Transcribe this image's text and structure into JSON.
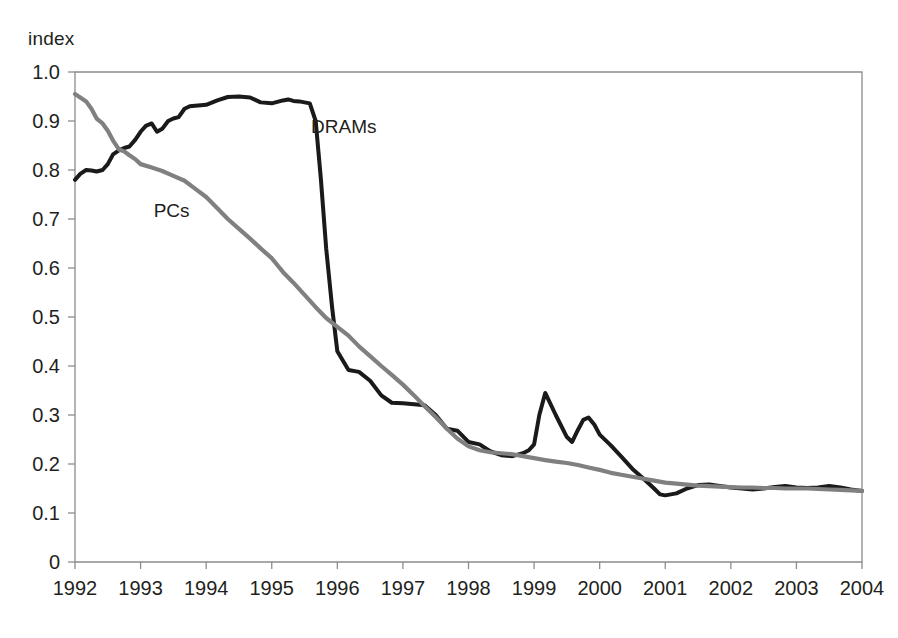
{
  "axis_label": "index",
  "colors": {
    "dram_line": "#1a1a1a",
    "pc_line": "#808080",
    "axis": "#8c8c8c",
    "text": "#231f20",
    "background": "#ffffff"
  },
  "labels": {
    "dram_series": "DRAMs",
    "pc_series": "PCs"
  },
  "chart_data": {
    "type": "line",
    "title": "",
    "subtitle": "",
    "xlabel": "",
    "ylabel": "index",
    "xlim": [
      1992,
      2004
    ],
    "ylim": [
      0,
      1.0
    ],
    "grid": false,
    "legend_position": "inline-annotation",
    "x_tick_labels": [
      "1992",
      "1993",
      "1994",
      "1995",
      "1996",
      "1997",
      "1998",
      "1999",
      "2000",
      "2001",
      "2002",
      "2003",
      "2004"
    ],
    "y_tick_labels": [
      "0",
      "0.1",
      "0.2",
      "0.3",
      "0.4",
      "0.5",
      "0.6",
      "0.7",
      "0.8",
      "0.9",
      "1.0"
    ],
    "x_ticks": [
      1992,
      1993,
      1994,
      1995,
      1996,
      1997,
      1998,
      1999,
      2000,
      2001,
      2002,
      2003,
      2004
    ],
    "y_ticks": [
      0,
      0.1,
      0.2,
      0.3,
      0.4,
      0.5,
      0.6,
      0.7,
      0.8,
      0.9,
      1.0
    ],
    "annotations": [
      {
        "text": "DRAMs",
        "x": 1995.6,
        "y": 0.875
      },
      {
        "text": "PCs",
        "x": 1993.2,
        "y": 0.705
      }
    ],
    "series": [
      {
        "name": "DRAMs",
        "color": "#1a1a1a",
        "x": [
          1992.0,
          1992.08,
          1992.17,
          1992.25,
          1992.33,
          1992.42,
          1992.5,
          1992.58,
          1992.67,
          1992.75,
          1992.83,
          1992.92,
          1993.0,
          1993.08,
          1993.17,
          1993.25,
          1993.33,
          1993.42,
          1993.5,
          1993.58,
          1993.67,
          1993.75,
          1993.83,
          1993.92,
          1994.0,
          1994.17,
          1994.33,
          1994.5,
          1994.67,
          1994.83,
          1995.0,
          1995.17,
          1995.25,
          1995.33,
          1995.42,
          1995.5,
          1995.58,
          1995.67,
          1995.75,
          1995.83,
          1995.92,
          1996.0,
          1996.17,
          1996.33,
          1996.5,
          1996.67,
          1996.83,
          1997.0,
          1997.17,
          1997.33,
          1997.5,
          1997.67,
          1997.83,
          1998.0,
          1998.17,
          1998.33,
          1998.5,
          1998.67,
          1998.83,
          1998.92,
          1999.0,
          1999.08,
          1999.17,
          1999.33,
          1999.5,
          1999.58,
          1999.67,
          1999.75,
          1999.83,
          1999.92,
          2000.0,
          2000.17,
          2000.33,
          2000.5,
          2000.67,
          2000.83,
          2000.92,
          2001.0,
          2001.17,
          2001.33,
          2001.5,
          2001.67,
          2001.83,
          2002.0,
          2002.17,
          2002.33,
          2002.5,
          2002.67,
          2002.83,
          2003.0,
          2003.17,
          2003.33,
          2003.5,
          2003.67,
          2003.83,
          2004.0
        ],
        "y": [
          0.78,
          0.792,
          0.8,
          0.799,
          0.797,
          0.8,
          0.812,
          0.832,
          0.84,
          0.845,
          0.848,
          0.862,
          0.878,
          0.89,
          0.895,
          0.878,
          0.884,
          0.9,
          0.905,
          0.908,
          0.925,
          0.93,
          0.931,
          0.932,
          0.933,
          0.942,
          0.949,
          0.95,
          0.948,
          0.938,
          0.936,
          0.942,
          0.944,
          0.941,
          0.94,
          0.938,
          0.936,
          0.9,
          0.78,
          0.64,
          0.52,
          0.43,
          0.392,
          0.388,
          0.37,
          0.34,
          0.325,
          0.324,
          0.322,
          0.32,
          0.3,
          0.272,
          0.268,
          0.245,
          0.24,
          0.226,
          0.218,
          0.216,
          0.222,
          0.228,
          0.24,
          0.3,
          0.345,
          0.3,
          0.255,
          0.245,
          0.27,
          0.29,
          0.295,
          0.28,
          0.26,
          0.238,
          0.215,
          0.19,
          0.17,
          0.15,
          0.138,
          0.136,
          0.14,
          0.15,
          0.157,
          0.158,
          0.155,
          0.152,
          0.15,
          0.148,
          0.15,
          0.153,
          0.155,
          0.152,
          0.151,
          0.152,
          0.155,
          0.152,
          0.148,
          0.145
        ]
      },
      {
        "name": "PCs",
        "color": "#808080",
        "x": [
          1992.0,
          1992.08,
          1992.17,
          1992.25,
          1992.33,
          1992.42,
          1992.5,
          1992.58,
          1992.67,
          1992.75,
          1992.83,
          1992.92,
          1993.0,
          1993.17,
          1993.33,
          1993.5,
          1993.67,
          1993.83,
          1994.0,
          1994.17,
          1994.33,
          1994.5,
          1994.67,
          1994.83,
          1995.0,
          1995.17,
          1995.33,
          1995.5,
          1995.67,
          1995.83,
          1996.0,
          1996.17,
          1996.33,
          1996.5,
          1996.67,
          1996.83,
          1997.0,
          1997.17,
          1997.33,
          1997.5,
          1997.67,
          1997.83,
          1998.0,
          1998.17,
          1998.33,
          1998.5,
          1998.67,
          1998.83,
          1999.0,
          1999.17,
          1999.33,
          1999.5,
          1999.67,
          1999.83,
          2000.0,
          2000.17,
          2000.33,
          2000.5,
          2000.67,
          2000.83,
          2001.0,
          2001.17,
          2001.33,
          2001.5,
          2001.67,
          2001.83,
          2002.0,
          2002.17,
          2002.33,
          2002.5,
          2002.67,
          2002.83,
          2003.0,
          2003.17,
          2003.33,
          2003.5,
          2003.67,
          2003.83,
          2004.0
        ],
        "y": [
          0.955,
          0.948,
          0.94,
          0.925,
          0.905,
          0.895,
          0.88,
          0.86,
          0.842,
          0.838,
          0.83,
          0.822,
          0.812,
          0.805,
          0.798,
          0.788,
          0.778,
          0.762,
          0.745,
          0.722,
          0.7,
          0.68,
          0.66,
          0.64,
          0.62,
          0.592,
          0.57,
          0.545,
          0.52,
          0.498,
          0.48,
          0.462,
          0.44,
          0.42,
          0.4,
          0.382,
          0.362,
          0.34,
          0.318,
          0.296,
          0.272,
          0.252,
          0.236,
          0.228,
          0.224,
          0.222,
          0.22,
          0.216,
          0.212,
          0.208,
          0.205,
          0.202,
          0.198,
          0.193,
          0.188,
          0.182,
          0.178,
          0.174,
          0.17,
          0.166,
          0.162,
          0.16,
          0.158,
          0.156,
          0.155,
          0.154,
          0.153,
          0.152,
          0.152,
          0.151,
          0.151,
          0.15,
          0.15,
          0.15,
          0.149,
          0.148,
          0.147,
          0.146,
          0.145
        ]
      }
    ]
  }
}
